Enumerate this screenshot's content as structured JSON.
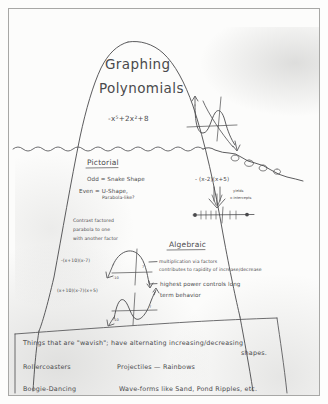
{
  "page": {
    "kind": "hand-drawn iceberg concept diagram",
    "background_color": "#fcfcfb",
    "ink_color": "#4a4a4c"
  },
  "title": {
    "line1": "Graphing",
    "line2": "Polynomials",
    "equation": "-x⁵+2x²+8"
  },
  "waterline": {
    "label": "wavy water line across iceberg"
  },
  "sections": {
    "pictorial": {
      "heading": "Pictorial",
      "lines": [
        "Odd = Snake Shape",
        "Even = U-Shape,",
        "Parabola-like?"
      ],
      "note_lines": [
        "Contrast factored",
        "parabola to one",
        "with another factor"
      ],
      "factored_expression": "- (x-2)(x+5)",
      "yields_label_line1": "yields",
      "yields_label_line2": "x-intercepts"
    },
    "algebraic": {
      "heading": "Algebraic",
      "bullets": [
        {
          "line1": "multiplication via factors",
          "line2": "contributes to rapidity of increase/decrease"
        },
        {
          "line1": "highest power controls long",
          "line2": "term behavior"
        }
      ]
    }
  },
  "examples": {
    "expression_quadratic": "-(x+10)(x-7)",
    "expression_cubic": "(x+10)(x-7)(x+5)",
    "quadratic_ticks": [
      "-10",
      "7"
    ],
    "cubic_ticks": [
      "-10",
      "7"
    ]
  },
  "bottom": {
    "summary_line1": "Things that are \"wavish\"; have alternating increasing/decreasing",
    "summary_line2": "shapes.",
    "items": [
      "Rollercoasters",
      "Projectiles — Rainbows",
      "Boogie-Dancing",
      "Wave-forms like Sand, Pond Ripples, etc."
    ]
  }
}
